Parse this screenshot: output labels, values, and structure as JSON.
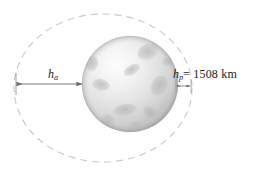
{
  "figure": {
    "type": "orbit-diagram",
    "background_color": "#ffffff",
    "labels": {
      "apoapsis": {
        "variable": "h",
        "subscript": "a",
        "full_text": "h_a"
      },
      "periapsis": {
        "variable": "h",
        "subscript": "p",
        "value_text": "= 1508 km",
        "value": 1508,
        "unit": "km",
        "full_text": "h_p = 1508 km"
      }
    },
    "body": {
      "name": "planet-sphere",
      "shape": "sphere",
      "fill_light": "#fbfbfb",
      "fill_mid": "#dcdcdc",
      "fill_dark": "#a8a8a8",
      "crater_color": "#b9b9b9",
      "center_x": 130,
      "center_y": 84,
      "radius": 48
    },
    "orbit": {
      "name": "orbit-ellipse",
      "style": "dashed",
      "stroke_color": "#c9c9c9",
      "center_x": 103,
      "center_y": 88,
      "radius_x": 89,
      "radius_y": 74
    },
    "arrows": {
      "apoapsis_arrow": {
        "stroke_color": "#6e6e6e",
        "from_x": 16,
        "to_x": 83,
        "y": 84,
        "heads": "both"
      },
      "periapsis_arrow": {
        "stroke_color": "#6e6e6e",
        "from_x": 176,
        "to_x": 191,
        "y": 86,
        "heads": "both"
      }
    }
  }
}
